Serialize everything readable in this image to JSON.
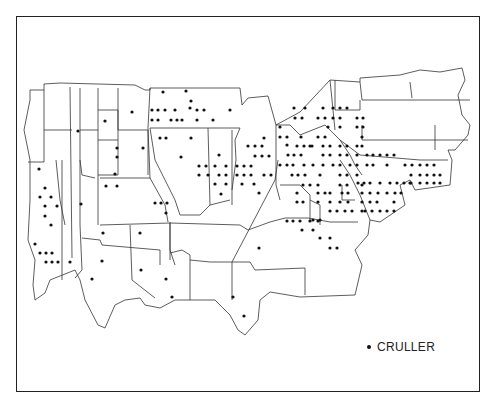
{
  "legend": {
    "symbol": "dot",
    "label": "CRULLER"
  },
  "colors": {
    "outline": "#333333",
    "dot": "#111111",
    "background": "#ffffff"
  },
  "map": {
    "outer": "M30,90 L44,90 L44,84 L60,83 L135,85 L145,90 L150,90 L150,88 L240,88 L242,105 L248,98 L268,96 L276,125 L300,112 L330,80 L360,82 L360,78 L400,75 L420,70 L440,72 L462,68 L465,80 L458,95 L462,115 L470,125 L468,135 L455,150 L448,150 L452,160 L450,185 L415,190 L410,180 L400,185 L405,205 L380,222 L370,220 L368,235 L355,250 L362,265 L355,295 L300,297 L270,292 L260,300 L258,320 L245,335 L238,330 L230,315 L215,300 L175,300 L160,308 L145,305 L140,298 L125,300 L115,305 L105,328 L98,325 L85,300 L80,280 L75,270 L50,280 L45,293 L35,300 L33,285 L35,260 L28,240 L30,200 L30,160 L24,130 L30,100 Z",
    "lines": [
      "M44,90 L44,162",
      "M70,87 L72,258",
      "M80,88 L80,225",
      "M98,88 L98,225",
      "M118,88 L118,130",
      "M44,130 L72,130",
      "M44,162 L28,162",
      "M98,110 L118,110 L118,175",
      "M80,130 L98,130",
      "M98,140 L118,140",
      "M118,130 L148,130 L148,175",
      "M118,175 L98,175",
      "M100,178 L150,178 L165,205 L168,222",
      "M150,178 L148,128 L150,88",
      "M150,128 L185,128 L240,128",
      "M62,160 L62,280",
      "M56,160 L60,200 L65,225",
      "M80,160 L82,175 L95,178",
      "M100,225 L170,223 L170,260",
      "M80,225 L82,270 L75,278",
      "M130,225 L132,280 L155,298",
      "M82,238 L100,240 L102,245 L160,250 L160,265",
      "M170,222 L170,250 L175,265",
      "M170,253 L182,250 L190,255 L190,300",
      "M170,223 L240,225 L248,230",
      "M190,260 L210,262 L232,262 L232,300",
      "M232,262 L250,262 L255,270 L305,268 L305,295",
      "M248,230 L270,222 L285,218 L308,218 L330,222 L358,222",
      "M232,262 L275,180 L278,160",
      "M276,125 L276,185 L280,200",
      "M208,128 L210,205",
      "M232,130 L232,205",
      "M240,128 L235,140 L236,160 L232,190",
      "M150,128 L155,160 L175,200 L180,215 L200,215 L210,205 L230,200",
      "M276,125 L290,125 L300,135 L325,125 L340,140 L350,155 L355,165 L362,175",
      "M330,80 L335,130",
      "M335,80 L335,110 L360,110 L360,100",
      "M360,82 L362,100 L470,100",
      "M362,125 L362,140 L468,140",
      "M435,125 L435,150",
      "M410,82 L412,98",
      "M340,140 L360,155 L420,160 L448,160",
      "M280,185 L300,185 L310,195 L310,220",
      "M310,200 L320,205 L320,225",
      "M342,185 L342,200 L355,200",
      "M340,160 L350,175 L360,195 L370,220"
    ],
    "dots": [
      [
        163,
        92
      ],
      [
        186,
        91
      ],
      [
        152,
        110
      ],
      [
        158,
        110
      ],
      [
        165,
        110
      ],
      [
        175,
        110
      ],
      [
        152,
        120
      ],
      [
        158,
        120
      ],
      [
        171,
        120
      ],
      [
        177,
        120
      ],
      [
        182,
        120
      ],
      [
        197,
        110
      ],
      [
        204,
        110
      ],
      [
        197,
        120
      ],
      [
        213,
        120
      ],
      [
        230,
        110
      ],
      [
        191,
        101
      ],
      [
        190,
        108
      ],
      [
        132,
        112
      ],
      [
        105,
        121
      ],
      [
        78,
        131
      ],
      [
        160,
        138
      ],
      [
        166,
        138
      ],
      [
        191,
        138
      ],
      [
        143,
        148
      ],
      [
        181,
        157
      ],
      [
        117,
        148
      ],
      [
        117,
        157
      ],
      [
        106,
        186
      ],
      [
        117,
        186
      ],
      [
        115,
        174
      ],
      [
        81,
        204
      ],
      [
        199,
        166
      ],
      [
        206,
        166
      ],
      [
        199,
        175
      ],
      [
        208,
        175
      ],
      [
        219,
        155
      ],
      [
        215,
        166
      ],
      [
        226,
        166
      ],
      [
        219,
        175
      ],
      [
        226,
        175
      ],
      [
        215,
        184
      ],
      [
        226,
        184
      ],
      [
        221,
        194
      ],
      [
        237,
        166
      ],
      [
        244,
        166
      ],
      [
        251,
        166
      ],
      [
        237,
        175
      ],
      [
        244,
        175
      ],
      [
        251,
        175
      ],
      [
        264,
        175
      ],
      [
        271,
        175
      ],
      [
        242,
        184
      ],
      [
        254,
        184
      ],
      [
        259,
        193
      ],
      [
        248,
        146
      ],
      [
        255,
        146
      ],
      [
        262,
        146
      ],
      [
        255,
        156
      ],
      [
        262,
        156
      ],
      [
        269,
        156
      ],
      [
        264,
        138
      ],
      [
        155,
        203
      ],
      [
        161,
        203
      ],
      [
        167,
        203
      ],
      [
        166,
        213
      ],
      [
        39,
        169
      ],
      [
        45,
        188
      ],
      [
        40,
        197
      ],
      [
        51,
        197
      ],
      [
        45,
        206
      ],
      [
        57,
        206
      ],
      [
        45,
        216
      ],
      [
        51,
        225
      ],
      [
        35,
        244
      ],
      [
        40,
        253
      ],
      [
        46,
        253
      ],
      [
        52,
        253
      ],
      [
        46,
        262
      ],
      [
        52,
        262
      ],
      [
        58,
        262
      ],
      [
        70,
        262
      ],
      [
        103,
        233
      ],
      [
        140,
        233
      ],
      [
        102,
        261
      ],
      [
        92,
        279
      ],
      [
        141,
        270
      ],
      [
        166,
        279
      ],
      [
        172,
        297
      ],
      [
        233,
        297
      ],
      [
        244,
        316
      ],
      [
        280,
        127
      ],
      [
        280,
        137
      ],
      [
        287,
        137
      ],
      [
        294,
        108
      ],
      [
        305,
        108
      ],
      [
        295,
        118
      ],
      [
        302,
        118
      ],
      [
        318,
        118
      ],
      [
        325,
        118
      ],
      [
        323,
        108
      ],
      [
        333,
        108
      ],
      [
        340,
        108
      ],
      [
        347,
        108
      ],
      [
        333,
        118
      ],
      [
        340,
        118
      ],
      [
        328,
        127
      ],
      [
        340,
        127
      ],
      [
        357,
        118
      ],
      [
        363,
        118
      ],
      [
        357,
        127
      ],
      [
        363,
        127
      ],
      [
        287,
        145
      ],
      [
        301,
        137
      ],
      [
        318,
        137
      ],
      [
        325,
        137
      ],
      [
        297,
        146
      ],
      [
        304,
        146
      ],
      [
        312,
        146
      ],
      [
        323,
        146
      ],
      [
        330,
        146
      ],
      [
        340,
        146
      ],
      [
        347,
        146
      ],
      [
        357,
        146
      ],
      [
        362,
        137
      ],
      [
        288,
        155
      ],
      [
        294,
        155
      ],
      [
        301,
        155
      ],
      [
        310,
        146
      ],
      [
        323,
        155
      ],
      [
        330,
        155
      ],
      [
        340,
        155
      ],
      [
        347,
        155
      ],
      [
        357,
        155
      ],
      [
        362,
        146
      ],
      [
        287,
        165
      ],
      [
        293,
        165
      ],
      [
        304,
        165
      ],
      [
        313,
        165
      ],
      [
        323,
        165
      ],
      [
        333,
        165
      ],
      [
        340,
        165
      ],
      [
        350,
        165
      ],
      [
        357,
        165
      ],
      [
        367,
        155
      ],
      [
        373,
        155
      ],
      [
        380,
        155
      ],
      [
        387,
        155
      ],
      [
        394,
        155
      ],
      [
        280,
        165
      ],
      [
        292,
        175
      ],
      [
        298,
        175
      ],
      [
        305,
        175
      ],
      [
        320,
        175
      ],
      [
        340,
        175
      ],
      [
        347,
        175
      ],
      [
        357,
        175
      ],
      [
        367,
        165
      ],
      [
        373,
        165
      ],
      [
        387,
        165
      ],
      [
        405,
        165
      ],
      [
        412,
        165
      ],
      [
        420,
        165
      ],
      [
        427,
        165
      ],
      [
        434,
        165
      ],
      [
        303,
        185
      ],
      [
        310,
        185
      ],
      [
        318,
        185
      ],
      [
        340,
        185
      ],
      [
        347,
        185
      ],
      [
        362,
        185
      ],
      [
        411,
        175
      ],
      [
        420,
        175
      ],
      [
        427,
        175
      ],
      [
        434,
        175
      ],
      [
        440,
        175
      ],
      [
        358,
        183
      ],
      [
        364,
        183
      ],
      [
        370,
        183
      ],
      [
        380,
        183
      ],
      [
        390,
        183
      ],
      [
        397,
        183
      ],
      [
        404,
        183
      ],
      [
        410,
        183
      ],
      [
        297,
        193
      ],
      [
        318,
        193
      ],
      [
        325,
        193
      ],
      [
        330,
        193
      ],
      [
        342,
        193
      ],
      [
        348,
        193
      ],
      [
        362,
        193
      ],
      [
        370,
        193
      ],
      [
        378,
        193
      ],
      [
        387,
        193
      ],
      [
        395,
        193
      ],
      [
        401,
        193
      ],
      [
        411,
        183
      ],
      [
        420,
        183
      ],
      [
        427,
        183
      ],
      [
        434,
        183
      ],
      [
        440,
        183
      ],
      [
        297,
        202
      ],
      [
        303,
        202
      ],
      [
        318,
        202
      ],
      [
        330,
        202
      ],
      [
        340,
        202
      ],
      [
        348,
        202
      ],
      [
        362,
        202
      ],
      [
        370,
        202
      ],
      [
        377,
        202
      ],
      [
        394,
        202
      ],
      [
        330,
        211
      ],
      [
        337,
        211
      ],
      [
        345,
        211
      ],
      [
        352,
        211
      ],
      [
        362,
        211
      ],
      [
        380,
        211
      ],
      [
        387,
        211
      ],
      [
        394,
        211
      ],
      [
        287,
        221
      ],
      [
        293,
        221
      ],
      [
        300,
        221
      ],
      [
        310,
        221
      ],
      [
        318,
        221
      ],
      [
        302,
        230
      ],
      [
        313,
        230
      ],
      [
        313,
        220
      ],
      [
        320,
        220
      ],
      [
        320,
        238
      ],
      [
        330,
        238
      ],
      [
        330,
        248
      ],
      [
        337,
        248
      ],
      [
        259,
        248
      ],
      [
        365,
        211
      ],
      [
        372,
        211
      ]
    ]
  }
}
